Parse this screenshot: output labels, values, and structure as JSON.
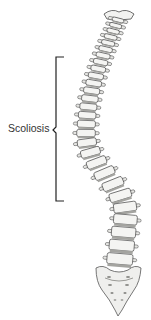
{
  "figure": {
    "label": "Scoliosis",
    "colors": {
      "background": "#ffffff",
      "bone": "#f2f2f0",
      "bone_shadow": "#b8b8b4",
      "outline": "#4a4a4a",
      "disc": "#9a9a96",
      "bracket": "#222222",
      "label_text": "#333333"
    },
    "bracket": {
      "x": 56,
      "y_top": 57,
      "y_bottom": 201,
      "tick_length": 8
    }
  }
}
